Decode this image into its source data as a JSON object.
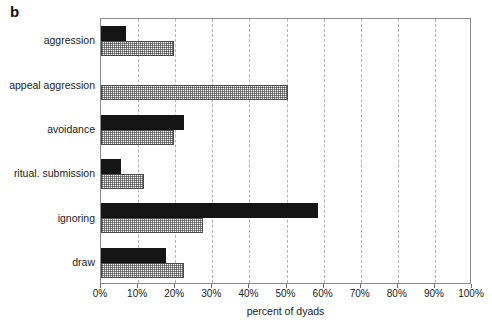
{
  "figure": {
    "panel_letter": "b"
  },
  "chart_data": {
    "type": "bar",
    "orientation": "horizontal",
    "title": "",
    "subtitle": "",
    "xlabel": "percent of dyads",
    "ylabel": "",
    "xlim": [
      0,
      100
    ],
    "xticks": [
      0,
      10,
      20,
      30,
      40,
      50,
      60,
      70,
      80,
      90,
      100
    ],
    "xtick_labels": [
      "0%",
      "10%",
      "20%",
      "30%",
      "40%",
      "50%",
      "60%",
      "70%",
      "80%",
      "90%",
      "100%"
    ],
    "grid": "vertical dashed gridlines at each 10% tick",
    "legend": "none",
    "categories": [
      "aggression",
      "appeal aggression",
      "avoidance",
      "ritual. submission",
      "ignoring",
      "draw"
    ],
    "series": [
      {
        "name": "black",
        "style": "solid black fill",
        "color": "#151515",
        "values": [
          6.7,
          0.0,
          22.4,
          5.4,
          58.5,
          17.5
        ]
      },
      {
        "name": "hatched",
        "style": "light stippled/hatched fill with dark outline",
        "color": "#ffffff",
        "values": [
          19.7,
          50.4,
          19.7,
          11.6,
          27.5,
          22.4
        ]
      }
    ]
  },
  "colors": {
    "dark_bar": "#151515",
    "hatch_outline": "#4a4a4a",
    "frame": "#8a8a8a",
    "gridline": "#b4b4b4",
    "text": "#1a1a1a",
    "background": "#ffffff"
  }
}
